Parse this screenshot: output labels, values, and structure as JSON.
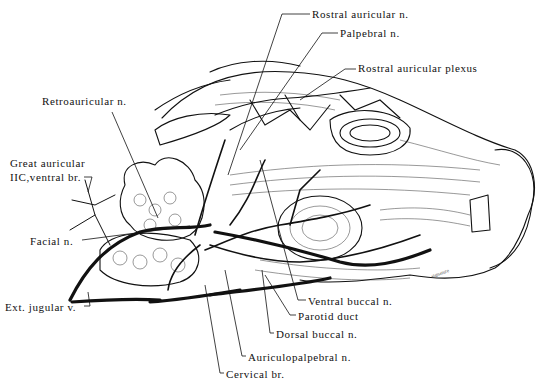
{
  "figure": {
    "labels": [
      {
        "id": "rostral-auricular-n",
        "text": "Rostral auricular n.",
        "x": 312,
        "y": 12
      },
      {
        "id": "palpebral-n",
        "text": "Palpebral n.",
        "x": 340,
        "y": 31
      },
      {
        "id": "rostral-auricular-plexus",
        "text": "Rostral auricular plexus",
        "x": 358,
        "y": 66
      },
      {
        "id": "retroauricular-n",
        "text": "Retroauricular n.",
        "x": 42,
        "y": 98
      },
      {
        "id": "great-auricular",
        "text": "Great auricular",
        "x": 10,
        "y": 160
      },
      {
        "id": "iic-ventral-br",
        "text": "IIC,ventral br.",
        "x": 10,
        "y": 173
      },
      {
        "id": "facial-n",
        "text": "Facial n.",
        "x": 30,
        "y": 236
      },
      {
        "id": "ext-jugular-v",
        "text": "Ext. jugular v.",
        "x": 5,
        "y": 303
      },
      {
        "id": "ventral-buccal-n",
        "text": "Ventral buccal n.",
        "x": 308,
        "y": 297
      },
      {
        "id": "parotid-duct",
        "text": "Parotid duct",
        "x": 298,
        "y": 312
      },
      {
        "id": "dorsal-buccal-n",
        "text": "Dorsal buccal n.",
        "x": 276,
        "y": 329
      },
      {
        "id": "auriculopalpebral-n",
        "text": "Auriculopalpebral n.",
        "x": 248,
        "y": 353
      },
      {
        "id": "cervical-br",
        "text": "Cervical br.",
        "x": 226,
        "y": 370
      }
    ]
  }
}
